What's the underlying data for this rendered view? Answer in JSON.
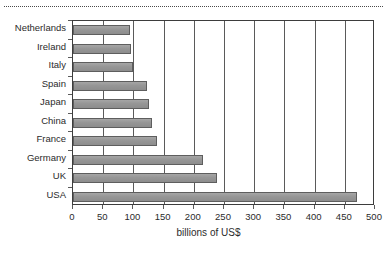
{
  "decor": {
    "top_rule": "dotted-rule"
  },
  "chart_data": {
    "type": "bar",
    "orientation": "horizontal",
    "title": "",
    "subtitle": "",
    "xlabel": "billions of US$",
    "ylabel": "",
    "categories": [
      "Netherlands",
      "Ireland",
      "Italy",
      "Spain",
      "Japan",
      "China",
      "France",
      "Germany",
      "UK",
      "USA"
    ],
    "values": [
      94,
      96,
      100,
      122,
      126,
      130,
      139,
      215,
      238,
      470
    ],
    "series": [
      {
        "name": "billions of US$",
        "values": [
          94,
          96,
          100,
          122,
          126,
          130,
          139,
          215,
          238,
          470
        ]
      }
    ],
    "xlim": [
      0,
      500
    ],
    "xticks": [
      0,
      50,
      100,
      150,
      200,
      250,
      300,
      350,
      400,
      450,
      500
    ],
    "xtick_labels": [
      "0",
      "50",
      "100",
      "150",
      "200",
      "250",
      "300",
      "350",
      "400",
      "450",
      "500"
    ],
    "grid": "vertical",
    "legend": "none",
    "bar_color": "#9b9b9b",
    "bar_edge_color": "#5e5e5e",
    "axis_color": "#3d3d3d",
    "text_color": "#2b2b2b",
    "background": "#ffffff"
  }
}
